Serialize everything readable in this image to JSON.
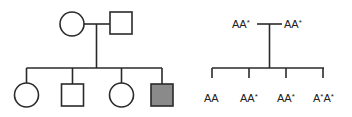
{
  "colors": {
    "stroke": "#2a2a2a",
    "affected_fill": "#8a8a8a",
    "unaffected_fill": "#ffffff",
    "background": "#ffffff"
  },
  "pedigree": {
    "parents": [
      {
        "sex": "female",
        "affected": false,
        "genotype": "AA*"
      },
      {
        "sex": "male",
        "affected": false,
        "genotype": "AA*"
      }
    ],
    "children": [
      {
        "sex": "female",
        "affected": false,
        "genotype": "AA"
      },
      {
        "sex": "male",
        "affected": false,
        "genotype": "AA*"
      },
      {
        "sex": "female",
        "affected": false,
        "genotype": "AA*"
      },
      {
        "sex": "male",
        "affected": true,
        "genotype": "A*A*"
      }
    ]
  },
  "genotype_chart": {
    "parent_labels": {
      "left": {
        "base": "AA",
        "sup": "*"
      },
      "right": {
        "base": "AA",
        "sup": "*"
      }
    },
    "child_labels": [
      {
        "base": "AA",
        "sup": ""
      },
      {
        "base": "AA",
        "sup": "*"
      },
      {
        "base": "AA",
        "sup": "*"
      },
      {
        "base": "A",
        "sup": "*",
        "base2": "A",
        "sup2": "*"
      }
    ]
  }
}
